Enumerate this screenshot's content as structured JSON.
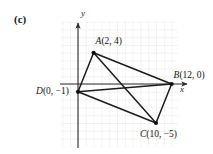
{
  "figure": {
    "part_label": "(c)",
    "axes": {
      "x_label": "x",
      "y_label": "y"
    },
    "grid": {
      "visible": true,
      "cell_px": 7.8,
      "color": "#d8d8d8"
    },
    "origin_px": {
      "x": 78,
      "y": 84
    }
  },
  "chart_data": {
    "type": "scatter",
    "title": "",
    "xlabel": "x",
    "ylabel": "y",
    "grid": true,
    "legend": "none",
    "xlim": [
      -2.5,
      13
    ],
    "ylim": [
      -8,
      7.5
    ],
    "points": [
      {
        "name": "A",
        "label": "A(2, 4)",
        "x": 2,
        "y": 4,
        "label_dx": 2,
        "label_dy": -9
      },
      {
        "name": "B",
        "label": "B(12, 0)",
        "x": 12,
        "y": 0,
        "label_dx": 2,
        "label_dy": -6
      },
      {
        "name": "C",
        "label": "C(10, −5)",
        "x": 10,
        "y": -5,
        "label_dx": -16,
        "label_dy": 14
      },
      {
        "name": "D",
        "label": "D(0, −1)",
        "x": 0,
        "y": -1,
        "label_dx": -42,
        "label_dy": 2
      }
    ],
    "segments": [
      {
        "from": "A",
        "to": "B"
      },
      {
        "from": "A",
        "to": "C"
      },
      {
        "from": "A",
        "to": "D"
      },
      {
        "from": "B",
        "to": "C"
      },
      {
        "from": "B",
        "to": "D"
      },
      {
        "from": "C",
        "to": "D"
      }
    ],
    "quadrilateral": [
      "A",
      "B",
      "C",
      "D"
    ],
    "diagonals": [
      [
        "A",
        "C"
      ],
      [
        "B",
        "D"
      ]
    ]
  }
}
